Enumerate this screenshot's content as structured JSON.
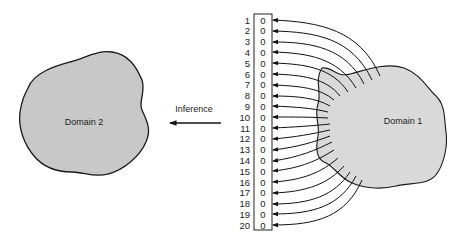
{
  "diagram": {
    "domain1": {
      "label": "Domain 1",
      "fill": "#d9d9d9"
    },
    "domain2": {
      "label": "Domain 2",
      "fill": "#c8c8c8"
    },
    "arrow": {
      "label": "Inference"
    },
    "vector": {
      "indices": [
        "1",
        "2",
        "3",
        "4",
        "5",
        "6",
        "7",
        "8",
        "9",
        "10",
        "11",
        "12",
        "13",
        "14",
        "15",
        "16",
        "17",
        "18",
        "19",
        "20"
      ],
      "values": [
        "0",
        "0",
        "0",
        "0",
        "0",
        "0",
        "0",
        "0",
        "0",
        "0",
        "0",
        "0",
        "0",
        "0",
        "0",
        "0",
        "0",
        "0",
        "0",
        "0"
      ]
    }
  }
}
